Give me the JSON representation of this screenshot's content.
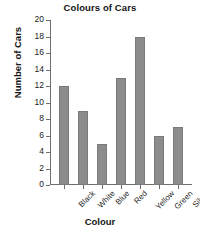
{
  "chart_data": {
    "type": "bar",
    "title": "Colours of Cars",
    "xlabel": "Colour",
    "ylabel": "Number of Cars",
    "categories": [
      "Black",
      "White",
      "Blue",
      "Red",
      "Yellow",
      "Green",
      "Silver"
    ],
    "values": [
      12,
      9,
      5,
      13,
      18,
      6,
      7
    ],
    "ylim": [
      0,
      20
    ],
    "ytick_step": 2,
    "yticks": [
      0,
      2,
      4,
      6,
      8,
      10,
      12,
      14,
      16,
      18,
      20
    ],
    "ytick_labels": [
      "0",
      "2",
      "4",
      "6",
      "8",
      "10",
      "12",
      "14",
      "16",
      "18",
      "20"
    ],
    "grid": false,
    "legend": false,
    "bar_color": "#8c8c8c",
    "axis_color": "#6e6e6e",
    "background_color": "#ffffff",
    "xtick_label_rotation": -45
  }
}
